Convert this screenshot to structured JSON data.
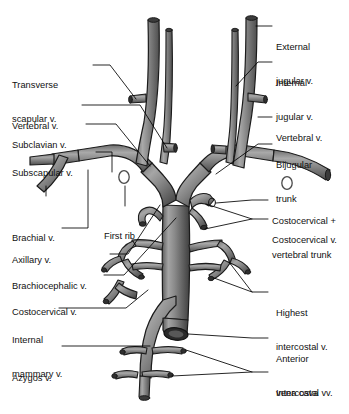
{
  "figure": {
    "type": "anatomical-illustration",
    "style": "grayscale line and tone drawing",
    "colors": {
      "background": "#ffffff",
      "vessel_dark": "#4a4a4a",
      "vessel_mid": "#7c7c7c",
      "vessel_light": "#b8b8b8",
      "vessel_outline": "#1a1a1a",
      "label_text": "#111111",
      "leader_line": "#000000"
    }
  },
  "labels": {
    "left": [
      {
        "id": "transverse-scapular-vein",
        "lines": [
          "Transverse",
          "scapular v."
        ]
      },
      {
        "id": "vertebral-vein-left",
        "lines": [
          "Vertebral v."
        ]
      },
      {
        "id": "subclavian-vein",
        "lines": [
          "Subclavian v."
        ]
      },
      {
        "id": "subscapular-vein",
        "lines": [
          "Subscapular v."
        ]
      },
      {
        "id": "brachial-vein",
        "lines": [
          "Brachial v."
        ]
      },
      {
        "id": "axillary-vein",
        "lines": [
          "Axillary v."
        ]
      },
      {
        "id": "brachiocephalic-vein",
        "lines": [
          "Brachiocephalic v."
        ]
      },
      {
        "id": "costocervical-vein-left",
        "lines": [
          "Costocervical v."
        ]
      },
      {
        "id": "internal-mammary-vein",
        "lines": [
          "Internal",
          "mammary v."
        ]
      },
      {
        "id": "azygos-vein",
        "lines": [
          "Azygos v."
        ]
      }
    ],
    "center": [
      {
        "id": "first-rib",
        "lines": [
          "First rib"
        ]
      }
    ],
    "right": [
      {
        "id": "external-jugular-vein",
        "lines": [
          "External",
          "jugular v."
        ]
      },
      {
        "id": "internal-jugular-vein",
        "lines": [
          "Internal",
          "jugular v."
        ]
      },
      {
        "id": "vertebral-vein-right",
        "lines": [
          "Vertebral v."
        ]
      },
      {
        "id": "bijugular-trunk",
        "lines": [
          "Bijugular",
          "trunk"
        ]
      },
      {
        "id": "costocervical-vertebral-trunk",
        "lines": [
          "Costocervical +",
          "vertebral trunk"
        ]
      },
      {
        "id": "costocervical-vein-right",
        "lines": [
          "Costocervical v."
        ]
      },
      {
        "id": "highest-intercostal-vein",
        "lines": [
          "Highest",
          "intercostal v."
        ]
      },
      {
        "id": "anterior-vena-cava",
        "lines": [
          "Anterior",
          "vena cava"
        ]
      },
      {
        "id": "intercostal-veins",
        "lines": [
          "Intercostal vv."
        ]
      }
    ]
  }
}
